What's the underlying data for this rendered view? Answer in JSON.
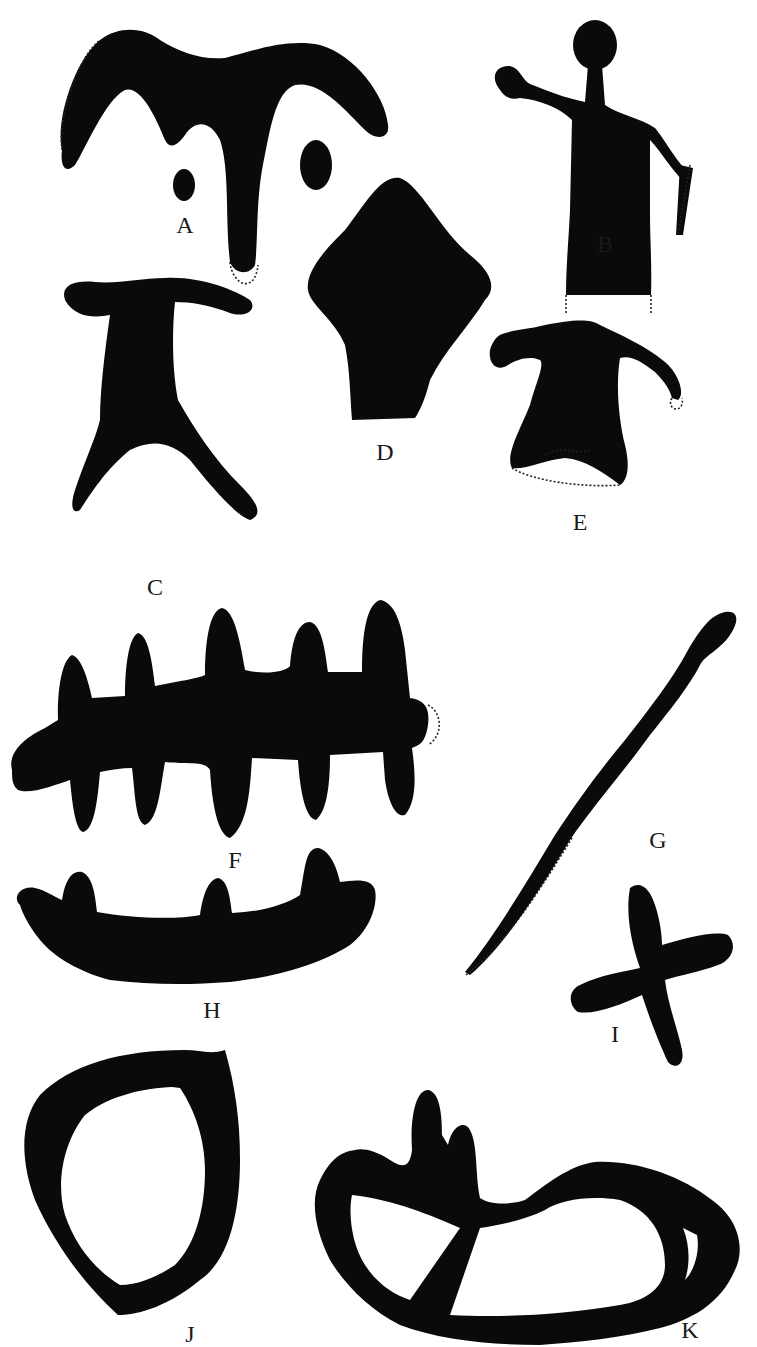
{
  "plate": {
    "background": "#ffffff",
    "ink_color": "#0a0a0a",
    "figures": [
      {
        "id": "A",
        "label": "A",
        "description": "horned head with two eye spots"
      },
      {
        "id": "B",
        "label": "B",
        "description": "human figure with raised arm"
      },
      {
        "id": "C",
        "label": "C",
        "description": "T-shaped figure with splayed legs"
      },
      {
        "id": "D",
        "label": "D",
        "description": "diamond-shaped figure"
      },
      {
        "id": "E",
        "label": "E",
        "description": "figure with outstretched arms, dotted outline restoration"
      },
      {
        "id": "F",
        "label": "F",
        "description": "comb / fishbone figure"
      },
      {
        "id": "G",
        "label": "G",
        "description": "long diagonal staff"
      },
      {
        "id": "H",
        "label": "H",
        "description": "curved boat with three prongs"
      },
      {
        "id": "I",
        "label": "I",
        "description": "cross figure"
      },
      {
        "id": "J",
        "label": "J",
        "description": "open oval ring"
      },
      {
        "id": "K",
        "label": "K",
        "description": "ring with divider and two prongs"
      }
    ]
  }
}
